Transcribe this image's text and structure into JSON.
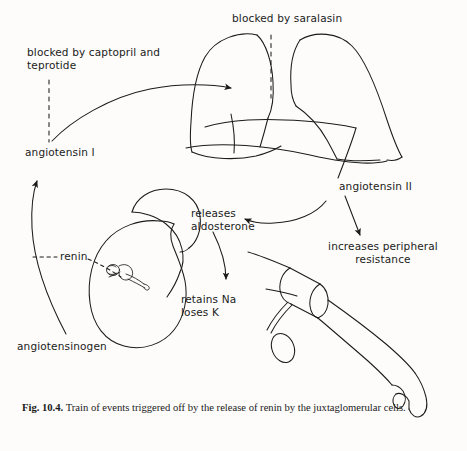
{
  "figure": {
    "id": "Fig. 10.4.",
    "caption_text": "Train of events triggered off by the release of renin by the juxtaglomerular cells.",
    "background_color": "#fdfcfa",
    "ink_color": "#1b1b1b"
  },
  "labels": {
    "blocked_captopril": "blocked by captopril and\nteprotide",
    "angiotensin_i": "angiotensin I",
    "blocked_saralasin": "blocked by saralasin",
    "angiotensin_ii": "angiotensin II",
    "increases_resistance": "increases peripheral\nresistance",
    "releases_aldosterone": "releases\naldosterone",
    "retains_loses": "retains Na\nloses K",
    "renin": "renin",
    "angiotensinogen": "angiotensinogen"
  },
  "anatomy": {
    "lungs": "lungs-illustration",
    "kidney": "kidney-illustration",
    "adrenal_gland": "adrenal-gland-illustration",
    "juxtaglomerular": "juxtaglomerular-cells-illustration",
    "arm_cuff": "arm-with-blood-pressure-cuff-illustration"
  },
  "connectors": {
    "angiotensinogen_to_angiotensin_i": "curved-arrow-up",
    "angiotensin_i_to_lungs": "curved-arrow-right",
    "angiotensin_ii_to_aldosterone": "curved-arrow-left",
    "angiotensin_ii_to_resistance": "straight-arrow-down",
    "aldosterone_to_retains": "curved-arrow-down",
    "renin_dash": "dashed-leader-line",
    "captopril_block": "dashed-block-line",
    "saralasin_block": "dashed-block-line",
    "angiotensin_ii_leader": "leader-line"
  }
}
